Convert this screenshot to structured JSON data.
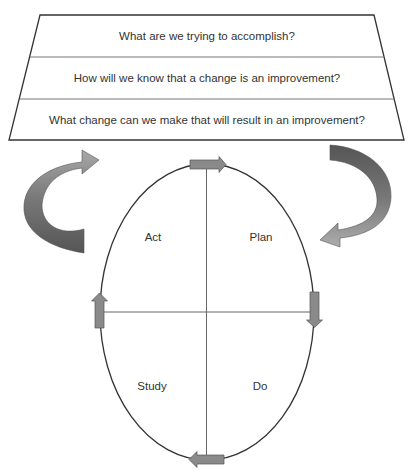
{
  "model_for_improvement": {
    "questions": [
      {
        "text": "What are we trying to accomplish?"
      },
      {
        "text": "How will we know that a change is an improvement?"
      },
      {
        "text": "What change can we make that will result in an improvement?"
      }
    ]
  },
  "pdsa_cycle": {
    "quadrants": {
      "act": "Act",
      "plan": "Plan",
      "study": "Study",
      "do": "Do"
    }
  },
  "colors": {
    "stroke": "#333333",
    "arrow_fill": "#8a8a8a",
    "arrow_dark": "#555555",
    "arrow_light": "#b5b5b5",
    "text": "#333333"
  }
}
